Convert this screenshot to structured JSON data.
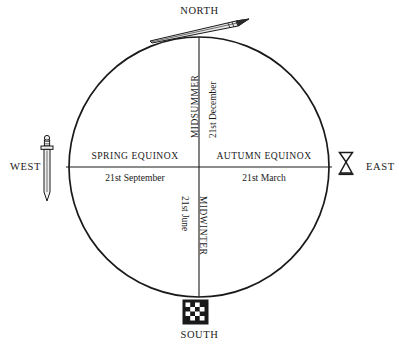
{
  "diagram": {
    "type": "compass-seasonal-wheel",
    "shape": "circle-with-cross-axes",
    "stroke_color": "#1a1a1a",
    "background_color": "#ffffff",
    "geometry": {
      "center_x": 199,
      "center_y": 167,
      "radius": 130,
      "vertical_axis_x": 199,
      "horizontal_axis_y": 167
    }
  },
  "cardinals": {
    "north": {
      "label": "NORTH",
      "icon": "spear-icon"
    },
    "south": {
      "label": "SOUTH",
      "icon": "checkerboard-shield-icon"
    },
    "west": {
      "label": "WEST",
      "icon": "sword-icon"
    },
    "east": {
      "label": "EAST",
      "icon": "goblet-hourglass-icon"
    }
  },
  "quadrants": {
    "spring": {
      "title": "SPRING EQUINOX",
      "date": "21st September"
    },
    "autumn": {
      "title": "AUTUMN EQUINOX",
      "date": "21st March"
    },
    "midsummer": {
      "title": "MIDSUMMER",
      "date": "21st December"
    },
    "midwinter": {
      "title": "MIDWINTER",
      "date": "21st June"
    }
  }
}
